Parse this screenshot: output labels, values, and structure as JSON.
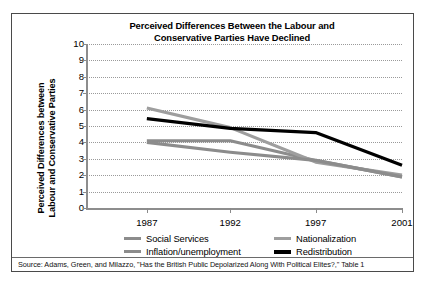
{
  "chart_data": {
    "type": "line",
    "title": "Perceived Differences Between the Labour and Conservative Parties Have Declined",
    "title_lines": [
      "Perceived Differences Between the Labour and",
      "Conservative Parties Have Declined"
    ],
    "xlabel": "",
    "ylabel": "Perceived Differences between Labour and Conservative Parties",
    "ylabel_lines": [
      "Perceived Differences between",
      "Labour and Conservative Parties"
    ],
    "categories": [
      "1987",
      "1992",
      "1997",
      "2001"
    ],
    "x": [
      1987,
      1992,
      1997,
      2001
    ],
    "ylim": [
      0,
      10
    ],
    "ytick_labels": [
      "10",
      "9",
      "8",
      "7",
      "6",
      "5",
      "4",
      "3",
      "2",
      "1",
      "0"
    ],
    "ytick_values": [
      10,
      9,
      8,
      7,
      6,
      5,
      4,
      3,
      2,
      1,
      0
    ],
    "grid": true,
    "legend_position": "bottom",
    "series": [
      {
        "name": "Social Services",
        "color": "#8c8c8c",
        "width": 3.2,
        "values": [
          4.1,
          4.1,
          2.9,
          1.9
        ]
      },
      {
        "name": "Nationalization",
        "color": "#9e9e9e",
        "width": 3.2,
        "values": [
          6.1,
          4.9,
          2.8,
          2.0
        ]
      },
      {
        "name": "Inflation/unemployment",
        "color": "#8c8c8c",
        "width": 3.2,
        "values": [
          4.0,
          3.4,
          2.9,
          1.9
        ]
      },
      {
        "name": "Redistribution",
        "color": "#000000",
        "width": 3.2,
        "values": [
          5.45,
          4.85,
          4.6,
          2.6
        ]
      }
    ]
  },
  "legend": {
    "rows": [
      [
        {
          "label": "Social Services",
          "color": "#8c8c8c",
          "thick": false
        },
        {
          "label": "Nationalization",
          "color": "#9e9e9e",
          "thick": false
        }
      ],
      [
        {
          "label": "Inflation/unemployment",
          "color": "#8c8c8c",
          "thick": false
        },
        {
          "label": "Redistribution",
          "color": "#000000",
          "thick": true
        }
      ]
    ]
  },
  "source": {
    "text": "Source: Adams, Green, and Milazzo, \"Has the British Public Depolarized Along With Political Elites?,\" Table 1"
  },
  "colors": {
    "axis": "#8d8d8d",
    "grid": "#9a9a9a",
    "border": "#4a4a4a",
    "text": "#000000"
  }
}
